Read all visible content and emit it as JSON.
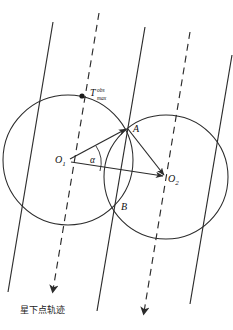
{
  "figure": {
    "type": "geometry-diagram",
    "background": "#ffffff",
    "stroke_color": "#2b2b2b",
    "caption": "星下点轨迹"
  },
  "labels": {
    "o1": "O",
    "o1_sub": "1",
    "o2": "O",
    "o2_sub": "2",
    "point_a": "A",
    "point_b": "B",
    "alpha": "α",
    "t_base": "T",
    "t_sup": "obs",
    "t_sub": "max"
  },
  "geometry": {
    "circles": [
      {
        "name": "left-circle",
        "cx": 68,
        "cy": 160,
        "r": 65
      },
      {
        "name": "right-circle",
        "cx": 166,
        "cy": 177,
        "r": 62
      }
    ],
    "points": [
      {
        "name": "O1",
        "x": 68,
        "y": 160
      },
      {
        "name": "O2",
        "x": 166,
        "y": 177
      },
      {
        "name": "A",
        "x": 128,
        "y": 127
      },
      {
        "name": "B",
        "x": 116,
        "y": 206
      },
      {
        "name": "Tmax",
        "x": 82,
        "y": 96
      }
    ],
    "segments": [
      {
        "from": "O1",
        "to": "A",
        "arrow": true
      },
      {
        "from": "O1",
        "to": "O2",
        "arrow": true
      },
      {
        "from": "A",
        "to": "O2",
        "arrow": true
      }
    ],
    "tracks": [
      {
        "name": "solid-track-1",
        "style": "solid",
        "x_top": 53,
        "y_top": 22,
        "x_bot": 8,
        "y_bot": 292
      },
      {
        "name": "dashed-track-1",
        "style": "dashed",
        "x_top": 99,
        "y_top": 13,
        "x_bot": 52,
        "y_bot": 296,
        "arrow": true
      },
      {
        "name": "solid-track-2",
        "style": "solid",
        "x_top": 145,
        "y_top": 27,
        "x_bot": 97,
        "y_bot": 310
      },
      {
        "name": "dashed-track-2",
        "style": "dashed",
        "x_top": 190,
        "y_top": 32,
        "x_bot": 143,
        "y_bot": 318,
        "arrow": true
      },
      {
        "name": "solid-track-3",
        "style": "solid",
        "x_top": 232,
        "y_top": 55,
        "x_bot": 190,
        "y_bot": 303
      }
    ]
  }
}
